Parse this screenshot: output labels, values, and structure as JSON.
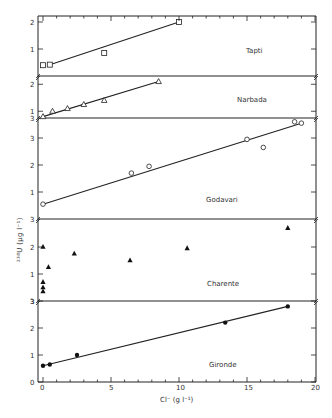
{
  "chart_data": {
    "type": "scatter",
    "title": "",
    "xlabel": "Cl⁻ (g l⁻¹)",
    "ylabel": "238U (μg l⁻¹)",
    "xlim": [
      0,
      20
    ],
    "xticks": [
      0,
      5,
      10,
      15,
      20
    ],
    "grid": false,
    "legend": "none (panel labels)",
    "panels": [
      {
        "name": "Tapti",
        "marker": "open-square",
        "yticks": [
          1,
          2
        ],
        "ybase": 0,
        "top_px": 16,
        "bottom_px": 76,
        "points": [
          [
            0,
            0.4
          ],
          [
            0.5,
            0.42
          ],
          [
            4.5,
            0.85
          ],
          [
            10,
            2.0
          ]
        ],
        "fit_line": [
          [
            0.5,
            0.42
          ],
          [
            10,
            2.0
          ]
        ]
      },
      {
        "name": "Narbada",
        "marker": "open-triangle",
        "yticks": [
          1,
          2
        ],
        "ybase": 0.75,
        "top_px": 76,
        "bottom_px": 118,
        "points": [
          [
            0,
            0.8
          ],
          [
            0.7,
            1.0
          ],
          [
            1.8,
            1.1
          ],
          [
            3.0,
            1.25
          ],
          [
            4.5,
            1.4
          ],
          [
            8.5,
            2.1
          ]
        ],
        "fit_line": [
          [
            0,
            0.8
          ],
          [
            8.5,
            2.1
          ]
        ]
      },
      {
        "name": "Godavari",
        "marker": "open-circle",
        "yticks": [
          1,
          2,
          3
        ],
        "ybase": 0,
        "top_px": 118,
        "bottom_px": 219,
        "points": [
          [
            0,
            0.55
          ],
          [
            6.5,
            1.7
          ],
          [
            7.8,
            1.95
          ],
          [
            15,
            2.95
          ],
          [
            16.2,
            2.65
          ],
          [
            18.5,
            3.6
          ],
          [
            19,
            3.55
          ]
        ],
        "fit_line": [
          [
            0,
            0.55
          ],
          [
            19,
            3.55
          ]
        ]
      },
      {
        "name": "Charente",
        "marker": "filled-triangle",
        "yticks": [
          1,
          2
        ],
        "ybase": 0,
        "top_px": 219,
        "bottom_px": 301,
        "points": [
          [
            0,
            2.0
          ],
          [
            0,
            0.7
          ],
          [
            0,
            0.5
          ],
          [
            0,
            0.35
          ],
          [
            0.4,
            1.25
          ],
          [
            2.3,
            1.75
          ],
          [
            6.4,
            1.5
          ],
          [
            10.6,
            1.95
          ],
          [
            18,
            2.7
          ]
        ],
        "fit_line": null
      },
      {
        "name": "Gironde",
        "marker": "filled-circle",
        "yticks": [
          0,
          1,
          2,
          3
        ],
        "ybase": 0,
        "top_px": 301,
        "bottom_px": 382,
        "points": [
          [
            0,
            0.6
          ],
          [
            0.5,
            0.65
          ],
          [
            2.5,
            1.0
          ],
          [
            13.4,
            2.2
          ],
          [
            18,
            2.8
          ]
        ],
        "fit_line": [
          [
            0,
            0.6
          ],
          [
            18,
            2.8
          ]
        ]
      }
    ]
  },
  "labels": {
    "panel_tapti": "Tapti",
    "panel_narbada": "Narbada",
    "panel_godavari": "Godavari",
    "panel_charente": "Charente",
    "panel_gironde": "Gironde",
    "xlabel": "Cl⁻ (g l⁻¹)",
    "ylabel": "²³⁸U (μg l⁻¹)",
    "x0": "0",
    "x5": "5",
    "x10": "10",
    "x15": "15",
    "x20": "20"
  }
}
